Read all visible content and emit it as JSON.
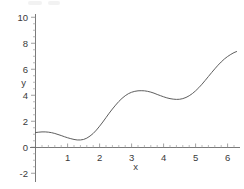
{
  "chart_data": {
    "type": "line",
    "title": "",
    "subtitle": "",
    "xlabel": "x",
    "ylabel": "y",
    "xlim": [
      -0.15,
      6.45
    ],
    "ylim": [
      -2,
      10
    ],
    "grid": false,
    "legend": null,
    "x_ticks": [
      1,
      2,
      3,
      4,
      5,
      6
    ],
    "x_tick_labels": [
      "1",
      "2",
      "3",
      "4",
      "5",
      "6"
    ],
    "y_ticks": [
      -2,
      0,
      2,
      4,
      6,
      8,
      10
    ],
    "y_tick_labels": [
      "-2",
      "0",
      "2",
      "4",
      "6",
      "8",
      "10"
    ],
    "minor_tick_step_x": 0.2,
    "minor_tick_step_y": 0.5,
    "series": [
      {
        "name": "curve",
        "color": "#555555",
        "x": [
          0.0,
          0.1,
          0.2,
          0.3,
          0.4,
          0.5,
          0.6,
          0.7,
          0.8,
          0.9,
          1.0,
          1.1,
          1.2,
          1.3,
          1.4,
          1.5,
          1.6,
          1.7,
          1.8,
          1.9,
          2.0,
          2.1,
          2.2,
          2.3,
          2.4,
          2.5,
          2.6,
          2.7,
          2.8,
          2.9,
          3.0,
          3.1,
          3.2,
          3.3,
          3.4,
          3.5,
          3.6,
          3.7,
          3.8,
          3.9,
          4.0,
          4.1,
          4.2,
          4.3,
          4.4,
          4.5,
          4.6,
          4.7,
          4.8,
          4.9,
          5.0,
          5.1,
          5.2,
          5.3,
          5.4,
          5.5,
          5.6,
          5.7,
          5.8,
          5.9,
          6.0,
          6.1,
          6.2,
          6.28
        ],
        "y": [
          1.15,
          1.18,
          1.2,
          1.2,
          1.18,
          1.14,
          1.08,
          1.0,
          0.92,
          0.83,
          0.75,
          0.68,
          0.62,
          0.58,
          0.58,
          0.62,
          0.72,
          0.88,
          1.08,
          1.34,
          1.64,
          1.96,
          2.3,
          2.64,
          2.96,
          3.26,
          3.54,
          3.78,
          3.98,
          4.14,
          4.25,
          4.32,
          4.36,
          4.37,
          4.36,
          4.32,
          4.26,
          4.18,
          4.08,
          3.99,
          3.9,
          3.82,
          3.76,
          3.72,
          3.7,
          3.71,
          3.76,
          3.85,
          3.98,
          4.15,
          4.36,
          4.6,
          4.87,
          5.16,
          5.46,
          5.76,
          6.05,
          6.33,
          6.58,
          6.81,
          7.0,
          7.16,
          7.3,
          7.38
        ]
      }
    ],
    "annotations": []
  },
  "axis": {
    "x_title": "x",
    "y_title": "y"
  }
}
